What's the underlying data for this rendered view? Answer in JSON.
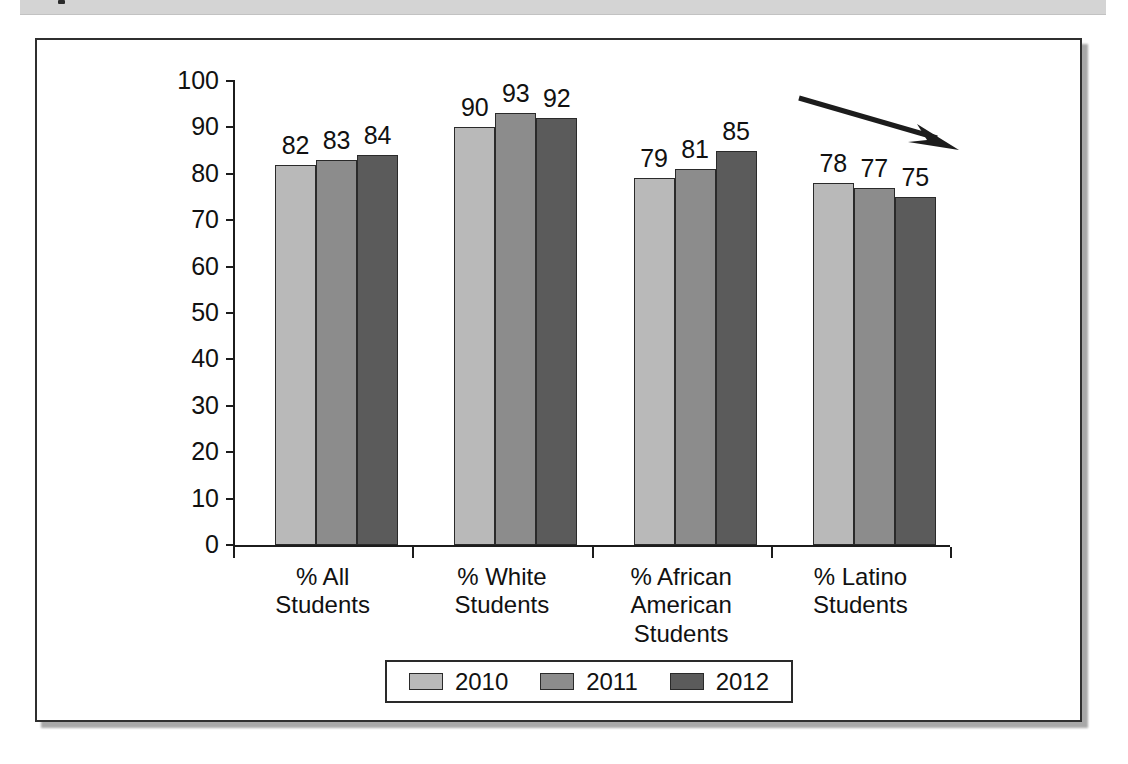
{
  "page": {
    "header_band": "scan-header-band"
  },
  "chart_data": {
    "type": "bar",
    "title": "",
    "subtitle": "",
    "xlabel": "",
    "ylabel": "",
    "ylim": [
      0,
      100
    ],
    "grid": false,
    "legend_position": "bottom",
    "categories": [
      "% All\nStudents",
      "% White\nStudents",
      "% African\nAmerican\nStudents",
      "% Latino\nStudents"
    ],
    "category_lines": [
      [
        "% All",
        "Students"
      ],
      [
        "% White",
        "Students"
      ],
      [
        "% African",
        "American",
        "Students"
      ],
      [
        "% Latino",
        "Students"
      ]
    ],
    "series": [
      {
        "name": "2010",
        "color": "#b9b9b9",
        "values": [
          82,
          90,
          79,
          78
        ]
      },
      {
        "name": "2011",
        "color": "#8c8c8c",
        "values": [
          83,
          93,
          81,
          77
        ]
      },
      {
        "name": "2012",
        "color": "#5b5b5b",
        "values": [
          84,
          92,
          85,
          75
        ]
      }
    ],
    "y_ticks": [
      100,
      90,
      80,
      70,
      60,
      50,
      40,
      30,
      20,
      10,
      0
    ],
    "y_tick_labels": [
      "100",
      "90",
      "80",
      "70",
      "60",
      "50",
      "40",
      "30",
      "20",
      "10",
      "0"
    ],
    "annotations": [
      {
        "kind": "arrow",
        "name": "downward-trend-arrow",
        "description": "arrow pointing down-right over the % Latino Students group",
        "from": [
          802,
          98
        ],
        "to": [
          921,
          134
        ]
      }
    ]
  },
  "legend": {
    "items": [
      {
        "label": "2010",
        "color": "#b9b9b9"
      },
      {
        "label": "2011",
        "color": "#8c8c8c"
      },
      {
        "label": "2012",
        "color": "#5b5b5b"
      }
    ]
  },
  "colors": {
    "series_2010": "#b9b9b9",
    "series_2011": "#8c8c8c",
    "series_2012": "#5b5b5b",
    "axis": "#1c1c1c",
    "frame": "#2f2f2f",
    "band": "#d4d4d4"
  }
}
